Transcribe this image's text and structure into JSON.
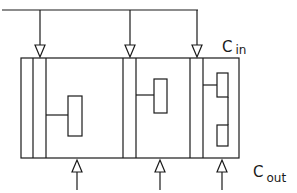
{
  "diagram": {
    "type": "block-schematic",
    "labels": {
      "c_in": {
        "main": "C",
        "sub": "in"
      },
      "c_out": {
        "main": "C",
        "sub": "out"
      }
    },
    "stroke_color": "#1a1a1a",
    "background": "#ffffff",
    "sections": [
      {
        "id": "section-1",
        "inner_blocks": 1
      },
      {
        "id": "section-2",
        "inner_blocks": 1
      },
      {
        "id": "section-3",
        "inner_blocks": 2
      }
    ],
    "top_input_arrows": 3,
    "bottom_input_arrows": 3
  }
}
